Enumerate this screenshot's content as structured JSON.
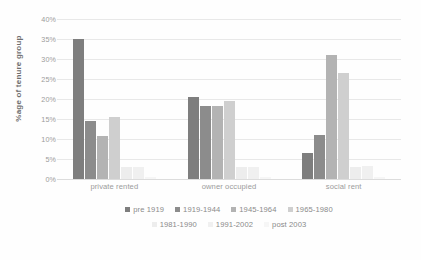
{
  "chart_data": {
    "type": "bar",
    "title": "",
    "subtitle": "",
    "xlabel": "",
    "ylabel": "%age of  tenure group",
    "categories": [
      "private rented",
      "owner occupied",
      "social rent"
    ],
    "ylim": [
      0,
      40
    ],
    "ytick_labels": [
      "40%",
      "35%",
      "30%",
      "25%",
      "20%",
      "15%",
      "10%",
      "5%",
      "0%"
    ],
    "ytick_values": [
      40,
      35,
      30,
      25,
      20,
      15,
      10,
      5,
      0
    ],
    "grid": true,
    "legend_position": "bottom",
    "series": [
      {
        "name": "pre 1919",
        "color": "#7e7e7e",
        "values": [
          35.0,
          20.5,
          6.5
        ]
      },
      {
        "name": "1919-1944",
        "color": "#8c8c8c",
        "values": [
          14.6,
          18.2,
          11.0
        ]
      },
      {
        "name": "1945-1964",
        "color": "#b3b3b3",
        "values": [
          10.7,
          18.3,
          31.0
        ]
      },
      {
        "name": "1965-1980",
        "color": "#cfcfcf",
        "values": [
          15.4,
          19.5,
          26.5
        ]
      },
      {
        "name": "1981-1990",
        "color": "#ededed",
        "values": [
          3.0,
          3.0,
          3.1
        ]
      },
      {
        "name": "1991-2002",
        "color": "#f0f0f0",
        "values": [
          3.0,
          3.1,
          3.2
        ]
      },
      {
        "name": "post 2003",
        "color": "#f6f6f6",
        "values": [
          0.4,
          0.4,
          0.5
        ]
      }
    ]
  },
  "legend": {
    "row1": [
      "pre 1919",
      "1919-1944",
      "1945-1964",
      "1965-1980"
    ],
    "row2": [
      "1981-1990",
      "1991-2002",
      "post 2003"
    ]
  },
  "colors": {
    "background": "#ffffff",
    "gridline": "#e8e8e8",
    "tick_text": "#9b9b9b",
    "axis_title": "#6f6f6f"
  }
}
